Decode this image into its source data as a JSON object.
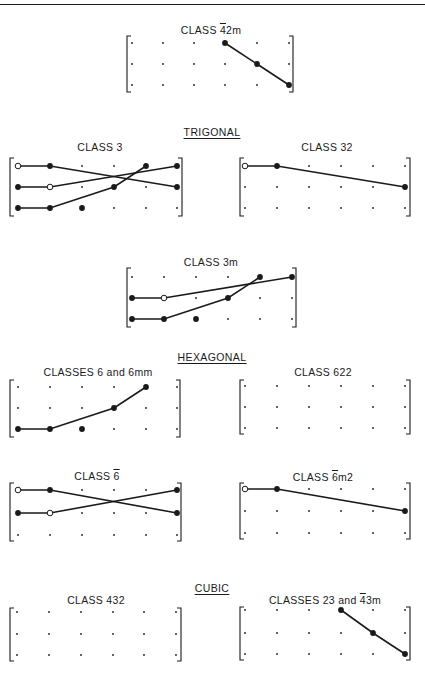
{
  "page": {
    "top_rule": true
  },
  "sections": [
    {
      "label": "TRIGONAL",
      "x": 212,
      "y": 126
    },
    {
      "label": "HEXAGONAL",
      "x": 212,
      "y": 351
    },
    {
      "label": "CUBIC",
      "x": 212,
      "y": 582
    }
  ],
  "diagrams": [
    {
      "id": "class-4bar2m",
      "title_prefix": "CLASS ",
      "title_bar": "4",
      "title_suffix": "2m",
      "title_x": 211,
      "title_y": 24,
      "box": {
        "x1": 127,
        "x2": 293,
        "y1": 36,
        "y2": 92
      },
      "cols": [
        132,
        163,
        194,
        225,
        257,
        289
      ],
      "rows": [
        43,
        64,
        85
      ],
      "filled": [
        [
          3,
          0
        ],
        [
          4,
          1
        ],
        [
          5,
          2
        ]
      ],
      "open": [],
      "big_dots": [],
      "lines": [
        [
          [
            3,
            0
          ],
          [
            4,
            1
          ],
          [
            5,
            2
          ]
        ]
      ]
    },
    {
      "id": "class-3",
      "title_prefix": "CLASS 3",
      "title_bar": "",
      "title_suffix": "",
      "title_x": 100,
      "title_y": 141,
      "box": {
        "x1": 10,
        "x2": 182,
        "y1": 158,
        "y2": 216
      },
      "cols": [
        18,
        50,
        82,
        114,
        146,
        177
      ],
      "rows": [
        166,
        187,
        208
      ],
      "filled": [
        [
          1,
          0
        ],
        [
          0,
          1
        ],
        [
          0,
          2
        ],
        [
          1,
          2
        ],
        [
          3,
          1
        ],
        [
          4,
          0
        ],
        [
          5,
          0
        ],
        [
          5,
          1
        ]
      ],
      "open": [
        [
          0,
          0
        ],
        [
          1,
          1
        ]
      ],
      "big_dots": [
        [
          2,
          2
        ]
      ],
      "lines": [
        [
          [
            0,
            0
          ],
          [
            1,
            0
          ],
          [
            5,
            1
          ]
        ],
        [
          [
            0,
            1
          ],
          [
            1,
            1
          ],
          [
            5,
            0
          ]
        ],
        [
          [
            0,
            2
          ],
          [
            1,
            2
          ],
          [
            3,
            1
          ],
          [
            4,
            0
          ]
        ]
      ]
    },
    {
      "id": "class-32",
      "title_prefix": "CLASS 32",
      "title_bar": "",
      "title_suffix": "",
      "title_x": 327,
      "title_y": 141,
      "box": {
        "x1": 240,
        "x2": 410,
        "y1": 158,
        "y2": 216
      },
      "cols": [
        245,
        277,
        309,
        341,
        373,
        405
      ],
      "rows": [
        166,
        187,
        208
      ],
      "filled": [
        [
          1,
          0
        ],
        [
          5,
          1
        ]
      ],
      "open": [
        [
          0,
          0
        ]
      ],
      "big_dots": [],
      "lines": [
        [
          [
            0,
            0
          ],
          [
            1,
            0
          ],
          [
            5,
            1
          ]
        ]
      ]
    },
    {
      "id": "class-3m",
      "title_prefix": "CLASS 3m",
      "title_bar": "",
      "title_suffix": "",
      "title_x": 211,
      "title_y": 256,
      "box": {
        "x1": 127,
        "x2": 296,
        "y1": 268,
        "y2": 327
      },
      "cols": [
        132,
        164,
        196,
        228,
        260,
        292
      ],
      "rows": [
        277,
        298,
        319
      ],
      "filled": [
        [
          0,
          1
        ],
        [
          0,
          2
        ],
        [
          1,
          2
        ],
        [
          3,
          1
        ],
        [
          4,
          0
        ],
        [
          5,
          0
        ]
      ],
      "open": [
        [
          1,
          1
        ]
      ],
      "big_dots": [
        [
          2,
          2
        ]
      ],
      "lines": [
        [
          [
            0,
            1
          ],
          [
            1,
            1
          ],
          [
            5,
            0
          ]
        ],
        [
          [
            0,
            2
          ],
          [
            1,
            2
          ],
          [
            3,
            1
          ],
          [
            4,
            0
          ]
        ]
      ]
    },
    {
      "id": "class-6-6mm",
      "title_prefix": "CLASSES 6 and 6mm",
      "title_bar": "",
      "title_suffix": "",
      "title_x": 98,
      "title_y": 366,
      "box": {
        "x1": 10,
        "x2": 180,
        "y1": 380,
        "y2": 437
      },
      "cols": [
        18,
        50,
        82,
        114,
        146,
        177
      ],
      "rows": [
        387,
        408,
        429
      ],
      "filled": [
        [
          0,
          2
        ],
        [
          1,
          2
        ],
        [
          3,
          1
        ],
        [
          4,
          0
        ]
      ],
      "open": [],
      "big_dots": [
        [
          2,
          2
        ]
      ],
      "lines": [
        [
          [
            0,
            2
          ],
          [
            1,
            2
          ],
          [
            3,
            1
          ],
          [
            4,
            0
          ]
        ]
      ]
    },
    {
      "id": "class-622",
      "title_prefix": "CLASS 622",
      "title_bar": "",
      "title_suffix": "",
      "title_x": 323,
      "title_y": 366,
      "box": {
        "x1": 240,
        "x2": 410,
        "y1": 380,
        "y2": 434
      },
      "cols": [
        245,
        277,
        309,
        341,
        373,
        405
      ],
      "rows": [
        386,
        407,
        428
      ],
      "filled": [],
      "open": [],
      "big_dots": [],
      "lines": []
    },
    {
      "id": "class-6bar",
      "title_prefix": "CLASS ",
      "title_bar": "6",
      "title_suffix": "",
      "title_x": 97,
      "title_y": 470,
      "box": {
        "x1": 10,
        "x2": 181,
        "y1": 483,
        "y2": 541
      },
      "cols": [
        18,
        50,
        82,
        114,
        146,
        177
      ],
      "rows": [
        490,
        513,
        535
      ],
      "filled": [
        [
          1,
          0
        ],
        [
          0,
          1
        ],
        [
          5,
          0
        ],
        [
          5,
          1
        ]
      ],
      "open": [
        [
          0,
          0
        ],
        [
          1,
          1
        ]
      ],
      "big_dots": [],
      "lines": [
        [
          [
            0,
            0
          ],
          [
            1,
            0
          ],
          [
            5,
            1
          ]
        ],
        [
          [
            0,
            1
          ],
          [
            1,
            1
          ],
          [
            5,
            0
          ]
        ]
      ]
    },
    {
      "id": "class-6barm2",
      "title_prefix": "CLASS ",
      "title_bar": "6",
      "title_suffix": "m2",
      "title_x": 323,
      "title_y": 471,
      "box": {
        "x1": 240,
        "x2": 410,
        "y1": 483,
        "y2": 539
      },
      "cols": [
        245,
        277,
        309,
        341,
        373,
        405
      ],
      "rows": [
        489,
        511,
        533
      ],
      "filled": [
        [
          1,
          0
        ],
        [
          5,
          1
        ]
      ],
      "open": [
        [
          0,
          0
        ]
      ],
      "big_dots": [],
      "lines": [
        [
          [
            0,
            0
          ],
          [
            1,
            0
          ],
          [
            5,
            1
          ]
        ]
      ]
    },
    {
      "id": "class-432",
      "title_prefix": "CLASS 432",
      "title_bar": "",
      "title_suffix": "",
      "title_x": 96,
      "title_y": 594,
      "box": {
        "x1": 10,
        "x2": 181,
        "y1": 608,
        "y2": 661
      },
      "cols": [
        17,
        49,
        81,
        113,
        144,
        176
      ],
      "rows": [
        612,
        634,
        655
      ],
      "filled": [],
      "open": [],
      "big_dots": [],
      "lines": []
    },
    {
      "id": "class-23-4bar3m",
      "title_prefix": "CLASSES 23 and ",
      "title_bar": "4",
      "title_suffix": "3m",
      "title_x": 325,
      "title_y": 594,
      "box": {
        "x1": 240,
        "x2": 410,
        "y1": 607,
        "y2": 660
      },
      "cols": [
        245,
        277,
        309,
        341,
        373,
        405
      ],
      "rows": [
        610,
        633,
        654
      ],
      "filled": [
        [
          3,
          0
        ],
        [
          4,
          1
        ],
        [
          5,
          2
        ]
      ],
      "open": [],
      "big_dots": [],
      "lines": [
        [
          [
            3,
            0
          ],
          [
            4,
            1
          ],
          [
            5,
            2
          ]
        ]
      ]
    }
  ],
  "colors": {
    "ink": "#1a1a1a",
    "paper": "#ffffff"
  }
}
